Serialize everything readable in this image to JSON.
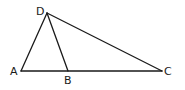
{
  "diagram": {
    "type": "triangle-with-cevian",
    "points": {
      "A": {
        "label": "A",
        "x": 21,
        "y": 71,
        "label_x": 10,
        "label_y": 75
      },
      "B": {
        "label": "B",
        "x": 68,
        "y": 71,
        "label_x": 64,
        "label_y": 84
      },
      "C": {
        "label": "C",
        "x": 162,
        "y": 71,
        "label_x": 164,
        "label_y": 75
      },
      "D": {
        "label": "D",
        "x": 47,
        "y": 13,
        "label_x": 36,
        "label_y": 15
      }
    },
    "segments": [
      {
        "from": "A",
        "to": "D"
      },
      {
        "from": "D",
        "to": "B"
      },
      {
        "from": "D",
        "to": "C"
      },
      {
        "from": "A",
        "to": "C"
      }
    ],
    "colors": {
      "line": "#1a1a1a",
      "background": "#ffffff"
    }
  }
}
